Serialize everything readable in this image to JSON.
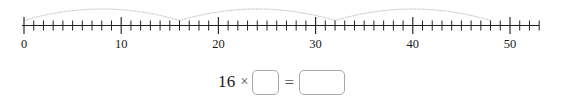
{
  "numberline": {
    "min": 0,
    "max": 53,
    "tick_step": 1,
    "major_tick_step": 10,
    "labels": [
      "0",
      "10",
      "20",
      "30",
      "40",
      "50"
    ],
    "label_values": [
      0,
      10,
      20,
      30,
      40,
      50
    ],
    "arc_color": "#b9b9b9",
    "axis_color": "#222222",
    "jumps": [
      {
        "from": 0,
        "to": 16,
        "size": 16
      },
      {
        "from": 16,
        "to": 32,
        "size": 16
      },
      {
        "from": 32,
        "to": 48,
        "size": 16
      }
    ]
  },
  "equation": {
    "multiplicand": "16",
    "operator": "×",
    "equals": "=",
    "factor_box_value": "",
    "product_box_value": "",
    "factor_box_placeholder": "",
    "product_box_placeholder": ""
  },
  "chart_data": {
    "type": "line",
    "title": "",
    "xlabel": "",
    "ylabel": "",
    "xlim": [
      0,
      53
    ],
    "grid": false,
    "legend": "none",
    "tick_labels": [
      "0",
      "10",
      "20",
      "30",
      "40",
      "50"
    ],
    "tick_values": [
      0,
      10,
      20,
      30,
      40,
      50
    ],
    "minor_tick_step": 1,
    "series": [
      {
        "name": "jumps-of-16",
        "type": "arc-hops",
        "values": [
          0,
          16,
          32,
          48
        ],
        "hop_size": 16,
        "hop_count": 3
      }
    ],
    "annotations": [
      "16 × □ = □"
    ]
  }
}
